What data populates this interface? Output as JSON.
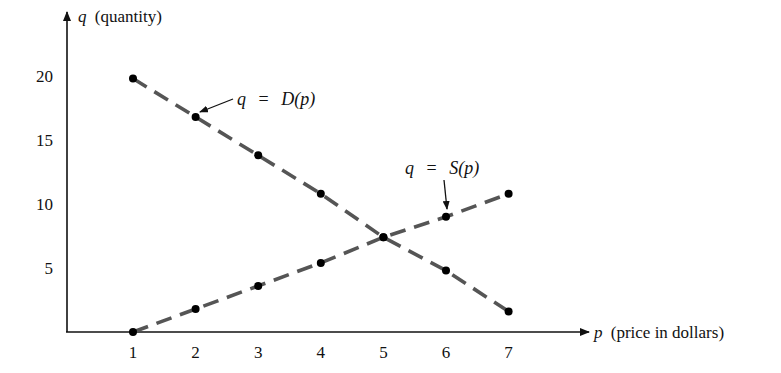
{
  "chart_data": {
    "type": "line",
    "title": "",
    "xlabel": "p (price in dollars)",
    "ylabel": "q (quantity)",
    "xlabel_var": "p",
    "xlabel_text": "(price in dollars)",
    "ylabel_var": "q",
    "ylabel_text": "(quantity)",
    "x": [
      1,
      2,
      3,
      4,
      5,
      6,
      7
    ],
    "x_ticks": [
      "1",
      "2",
      "3",
      "4",
      "5",
      "6",
      "7"
    ],
    "y_ticks": [
      "5",
      "10",
      "15",
      "20"
    ],
    "y_tick_values": [
      5,
      10,
      15,
      20
    ],
    "xlim": [
      0,
      7.6
    ],
    "ylim": [
      0,
      25
    ],
    "grid": false,
    "legend": "none (inline annotations)",
    "series": [
      {
        "name": "q = D(p)",
        "label_var": "q",
        "label_eq": "=",
        "label_fn": "D(p)",
        "style": "dashed",
        "markers": true,
        "values": [
          19.8,
          16.8,
          13.8,
          10.8,
          7.4,
          4.8,
          1.6
        ]
      },
      {
        "name": "q = S(p)",
        "label_var": "q",
        "label_eq": "=",
        "label_fn": "S(p)",
        "style": "dashed",
        "markers": true,
        "values": [
          0,
          1.8,
          3.6,
          5.4,
          7.4,
          9.0,
          10.8
        ]
      }
    ],
    "annotations": [
      {
        "text": "q = D(p)",
        "points_to": {
          "p": 2,
          "q": 16.8
        }
      },
      {
        "text": "q = S(p)",
        "points_to": {
          "p": 6,
          "q": 9.0
        }
      }
    ]
  },
  "colors": {
    "axis": "#111111",
    "line": "#555555",
    "marker": "#000000"
  }
}
